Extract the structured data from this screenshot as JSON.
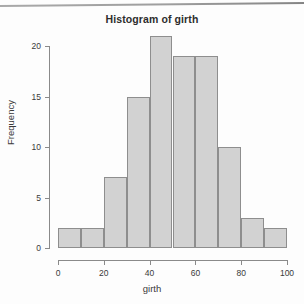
{
  "chart_data": {
    "type": "bar",
    "title": "Histogram of girth",
    "xlabel": "girth",
    "ylabel": "Frequency",
    "categories": [
      "0-10",
      "10-20",
      "20-30",
      "30-40",
      "40-50",
      "50-60",
      "60-70",
      "70-80",
      "80-90",
      "90-100"
    ],
    "bin_edges": [
      0,
      10,
      20,
      30,
      40,
      50,
      60,
      70,
      80,
      90,
      100
    ],
    "values": [
      2,
      2,
      7,
      15,
      21,
      19,
      19,
      10,
      3,
      2
    ],
    "xlim": [
      0,
      100
    ],
    "ylim": [
      0,
      21
    ],
    "xticks": [
      "0",
      "20",
      "40",
      "60",
      "80",
      "100"
    ],
    "xtick_values": [
      0,
      20,
      40,
      60,
      80,
      100
    ],
    "yticks": [
      "0",
      "5",
      "10",
      "15",
      "20"
    ],
    "ytick_values": [
      0,
      5,
      10,
      15,
      20
    ],
    "grid": false,
    "legend": null,
    "bar_fill_color": "#d2d2d2",
    "bar_border_color": "#8e8e8e",
    "axis_color": "#8a8a8a",
    "text_color": "#3a3a3a",
    "background_color": "#fdfdfd"
  }
}
